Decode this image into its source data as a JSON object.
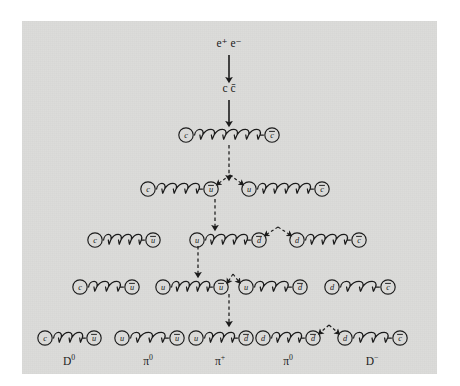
{
  "figure": {
    "background_color": "#dcdcda",
    "page_color": "#ffffff",
    "ink_color": "#1b1b1b"
  },
  "initial_state": {
    "label": "e⁺ e⁻",
    "x": 229,
    "y": 47
  },
  "intermediate_state": {
    "label": "c c̄",
    "x": 229,
    "y": 92
  },
  "arrows": [
    {
      "name": "arrow-ee-to-ccbar",
      "x": 229,
      "y1": 55,
      "y2": 80,
      "style": "solid"
    },
    {
      "name": "arrow-ccbar-to-row1",
      "x": 229,
      "y1": 100,
      "y2": 124,
      "style": "solid"
    },
    {
      "name": "arrow-row1-to-row2",
      "x": 229,
      "y1": 145,
      "y2": 178,
      "style": "dashed"
    },
    {
      "name": "arrow-row2-to-row3",
      "x": 215,
      "y1": 199,
      "y2": 228,
      "style": "dashed"
    },
    {
      "name": "arrow-row3-to-row4",
      "x": 198,
      "y1": 246,
      "y2": 275,
      "style": "dashed"
    },
    {
      "name": "arrow-row4-to-row5",
      "x": 229,
      "y1": 294,
      "y2": 324,
      "style": "dashed"
    }
  ],
  "rows": [
    {
      "name": "row-1-ccbar-string",
      "y": 135,
      "pairs": [
        {
          "left": "c",
          "right": "c̄",
          "x1": 186,
          "x2": 272
        }
      ],
      "break_pairs": []
    },
    {
      "name": "row-2-two-strings",
      "y": 189,
      "pairs": [
        {
          "left": "c",
          "right": "ū",
          "x1": 148,
          "x2": 211
        },
        {
          "left": "u",
          "right": "c̄",
          "x1": 249,
          "x2": 322
        }
      ],
      "break_pairs": [
        {
          "apex_x": 230,
          "apex_y": 175,
          "left_x": 211,
          "right_x": 249
        }
      ]
    },
    {
      "name": "row-3-three-strings",
      "y": 240,
      "pairs": [
        {
          "left": "c",
          "right": "ū",
          "x1": 95,
          "x2": 153
        },
        {
          "left": "u",
          "right": "d̄",
          "x1": 197,
          "x2": 259
        },
        {
          "left": "d",
          "right": "c̄",
          "x1": 297,
          "x2": 359
        }
      ],
      "break_pairs": [
        {
          "apex_x": 278,
          "apex_y": 227,
          "left_x": 259,
          "right_x": 297
        }
      ]
    },
    {
      "name": "row-4-four-strings",
      "y": 287,
      "pairs": [
        {
          "left": "c",
          "right": "ū",
          "x1": 80,
          "x2": 132
        },
        {
          "left": "u",
          "right": "ū",
          "x1": 163,
          "x2": 221
        },
        {
          "left": "u",
          "right": "d̄",
          "x1": 246,
          "x2": 300
        },
        {
          "left": "d",
          "right": "c̄",
          "x1": 332,
          "x2": 388
        }
      ],
      "break_pairs": [
        {
          "apex_x": 233,
          "apex_y": 274,
          "left_x": 221,
          "right_x": 246
        }
      ]
    },
    {
      "name": "row-5-final-hadrons",
      "y": 338,
      "pairs": [
        {
          "left": "c",
          "right": "ū",
          "x1": 45,
          "x2": 94
        },
        {
          "left": "u",
          "right": "ū",
          "x1": 122,
          "x2": 177
        },
        {
          "left": "u",
          "right": "d̄",
          "x1": 196,
          "x2": 246
        },
        {
          "left": "d",
          "right": "d̄",
          "x1": 263,
          "x2": 313
        },
        {
          "left": "d",
          "right": "c̄",
          "x1": 345,
          "x2": 400
        }
      ],
      "break_pairs": [
        {
          "apex_x": 329,
          "apex_y": 325,
          "left_x": 313,
          "right_x": 345
        }
      ]
    }
  ],
  "hadron_labels": [
    {
      "name": "hadron-label-d0",
      "text": "D",
      "sup": "0",
      "x": 69,
      "y": 365
    },
    {
      "name": "hadron-label-pi0-left",
      "text": "π",
      "sup": "0",
      "x": 148,
      "y": 365
    },
    {
      "name": "hadron-label-piplus",
      "text": "π",
      "sup": "+",
      "x": 220,
      "y": 365
    },
    {
      "name": "hadron-label-pi0-right",
      "text": "π",
      "sup": "0",
      "x": 288,
      "y": 365
    },
    {
      "name": "hadron-label-dminus",
      "text": "D",
      "sup": "−",
      "x": 372,
      "y": 365
    }
  ]
}
